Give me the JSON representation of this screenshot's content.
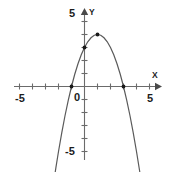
{
  "chart_data": {
    "type": "line",
    "title": "",
    "subtitle": "",
    "xlabel": "X",
    "ylabel": "Y",
    "xlim": [
      -5.6,
      5.6
    ],
    "ylim": [
      -5.8,
      5.4
    ],
    "grid": false,
    "legend": "none",
    "xticks": [
      -5,
      -4,
      -3,
      -2,
      -1,
      0,
      1,
      2,
      3,
      4,
      5
    ],
    "yticks": [
      -5,
      -4,
      -3,
      -2,
      -1,
      0,
      1,
      2,
      3,
      4,
      5
    ],
    "xtick_labels_shown": [
      "-5",
      "0",
      "5"
    ],
    "ytick_labels_shown": [
      "5",
      "-5"
    ],
    "series": [
      {
        "name": "parabola",
        "equation": "y = -x^2 + 2x + 3",
        "color": "#5a5a5a",
        "x": [
          -2.45,
          -2.2,
          -2.0,
          -1.75,
          -1.5,
          -1.25,
          -1.0,
          -0.75,
          -0.5,
          -0.25,
          0.0,
          0.25,
          0.5,
          0.75,
          1.0,
          1.25,
          1.5,
          1.75,
          2.0,
          2.25,
          2.5,
          2.75,
          3.0,
          3.25,
          3.5,
          3.75,
          4.0,
          4.25,
          4.45
        ],
        "y": [
          -7.9,
          -6.24,
          -5.0,
          -3.56,
          -2.25,
          -1.06,
          0.0,
          0.94,
          1.75,
          2.44,
          3.0,
          3.44,
          3.75,
          3.94,
          4.0,
          3.94,
          3.75,
          3.44,
          3.0,
          2.44,
          1.75,
          0.94,
          0.0,
          -1.06,
          -2.25,
          -3.56,
          -5.0,
          -6.56,
          -7.7
        ]
      }
    ],
    "marked_points": [
      {
        "name": "x-intercept-left",
        "x": -1.0,
        "y": 0.0
      },
      {
        "name": "y-intercept",
        "x": 0.0,
        "y": 3.0
      },
      {
        "name": "vertex",
        "x": 1.0,
        "y": 4.0
      },
      {
        "name": "x-intercept-right",
        "x": 3.0,
        "y": 0.0
      }
    ]
  },
  "labels": {
    "y_axis_name": "Y",
    "x_axis_name": "X",
    "y_top": "5",
    "y_bottom": "-5",
    "x_left": "-5",
    "x_right": "5",
    "origin": "0"
  },
  "colors": {
    "curve": "#5a5a5a",
    "axis": "#6b6b6b",
    "point": "#1a1a1a",
    "text": "#1c1c1c",
    "background": "#ffffff"
  }
}
